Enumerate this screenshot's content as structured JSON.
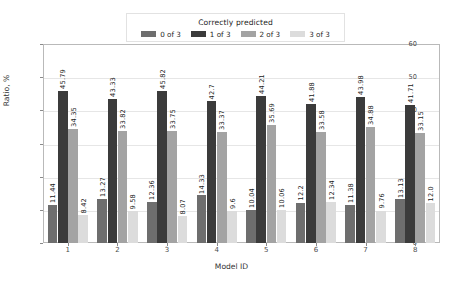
{
  "chart_data": {
    "type": "bar",
    "title": "",
    "xlabel": "Model ID",
    "ylabel": "Ratio, %",
    "categories": [
      "1",
      "2",
      "3",
      "4",
      "5",
      "6",
      "7",
      "8"
    ],
    "ylim": [
      0,
      60
    ],
    "yticks": [
      0,
      10,
      20,
      30,
      40,
      50,
      60
    ],
    "grid": true,
    "legend_title": "Correctly predicted",
    "legend_position": "upper center",
    "series": [
      {
        "name": "0 of 3",
        "color": "#6e6e6e",
        "values": [
          11.44,
          13.27,
          12.36,
          14.33,
          10.04,
          12.2,
          11.38,
          13.13
        ],
        "labels": [
          "11.44",
          "13.27",
          "12.36",
          "14.33",
          "10.04",
          "12.2",
          "11.38",
          "13.13"
        ]
      },
      {
        "name": "1 of 3",
        "color": "#3b3b3b",
        "values": [
          45.79,
          43.33,
          45.82,
          42.7,
          44.21,
          41.88,
          43.98,
          41.71
        ],
        "labels": [
          "45.79",
          "43.33",
          "45.82",
          "42.7",
          "44.21",
          "41.88",
          "43.98",
          "41.71"
        ]
      },
      {
        "name": "2 of 3",
        "color": "#a3a3a3",
        "values": [
          34.35,
          33.82,
          33.75,
          33.37,
          35.69,
          33.58,
          34.88,
          33.15
        ],
        "labels": [
          "34.35",
          "33.82",
          "33.75",
          "33.37",
          "35.69",
          "33.58",
          "34.88",
          "33.15"
        ]
      },
      {
        "name": "3 of 3",
        "color": "#dcdcdc",
        "values": [
          8.42,
          9.58,
          8.07,
          9.6,
          10.06,
          12.34,
          9.76,
          12.0
        ],
        "labels": [
          "8.42",
          "9.58",
          "8.07",
          "9.6",
          "10.06",
          "12.34",
          "9.76",
          "12.0"
        ]
      }
    ]
  }
}
